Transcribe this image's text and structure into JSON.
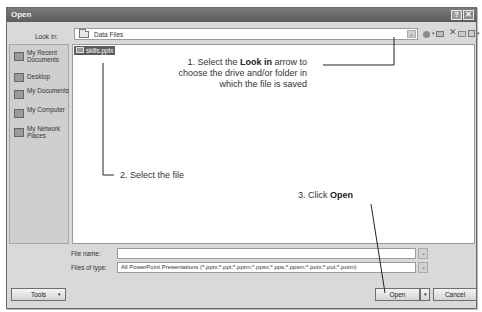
{
  "window": {
    "title": "Open",
    "help_button": "?",
    "close_button": "✕"
  },
  "look_in": {
    "label": "Look in:",
    "value": "Data Files",
    "arrow": "⌄"
  },
  "toolbar": {
    "icons": [
      "back-icon",
      "up-one-level-icon",
      "delete-icon",
      "new-folder-icon",
      "views-icon"
    ],
    "delete_glyph": "✕",
    "dropdown_glyph": "▾"
  },
  "places_bar": {
    "items": [
      {
        "label": "My Recent Documents",
        "icon": "recent-documents-icon"
      },
      {
        "label": "Desktop",
        "icon": "desktop-icon"
      },
      {
        "label": "My Documents",
        "icon": "my-documents-icon"
      },
      {
        "label": "My Computer",
        "icon": "my-computer-icon"
      },
      {
        "label": "My Network Places",
        "icon": "network-places-icon"
      }
    ]
  },
  "file_list": {
    "items": [
      {
        "name": "skills.pptx",
        "selected": true
      }
    ]
  },
  "callouts": {
    "step1_prefix": "1. Select the ",
    "step1_bold": "Look in",
    "step1_rest": "arrow to choose the drive and/or folder in which the file is saved",
    "step2": "2. Select the file",
    "step3_prefix": "3. Click ",
    "step3_bold": "Open"
  },
  "file_name": {
    "label": "File name:",
    "value": "",
    "arrow": "⌄"
  },
  "files_of_type": {
    "label": "Files of type:",
    "value": "All PowerPoint Presentations (*.pptx;*.ppt;*.pptm;*.ppsx;*.pps;*.ppsm;*.potx;*.pot;*.potm)",
    "arrow": "⌄"
  },
  "buttons": {
    "tools": "Tools",
    "tools_dropdown": "▾",
    "open": "Open",
    "open_dropdown": "▾",
    "cancel": "Cancel"
  }
}
